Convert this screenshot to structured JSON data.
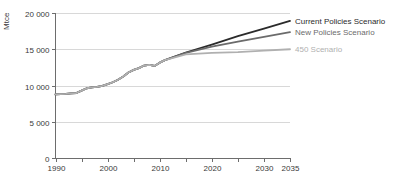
{
  "chart_data": {
    "type": "line",
    "title": "",
    "xlabel": "",
    "ylabel": "Mtce",
    "xlim": [
      1990,
      2035
    ],
    "ylim": [
      0,
      20000
    ],
    "grid": true,
    "legend_position": "right-inline",
    "x_ticks_major": [
      "1990",
      "2000",
      "2010",
      "2020",
      "2030",
      "2035"
    ],
    "x_ticks_major_values": [
      1990,
      2000,
      2010,
      2020,
      2030,
      2035
    ],
    "x_ticks_minor_values": [
      1995,
      2005,
      2015,
      2025
    ],
    "y_ticks": [
      "0",
      "5 000",
      "10 000",
      "15 000",
      "20 000"
    ],
    "y_tick_values": [
      0,
      5000,
      10000,
      15000,
      20000
    ],
    "history_end": 2011,
    "series": [
      {
        "name": "Current Policies Scenario",
        "color": "#2b2b2b",
        "stroke_width": 1.8,
        "x": [
          1990,
          1991,
          1992,
          1993,
          1994,
          1995,
          1996,
          1997,
          1998,
          1999,
          2000,
          2001,
          2002,
          2003,
          2004,
          2005,
          2006,
          2007,
          2008,
          2009,
          2010,
          2011,
          2015,
          2020,
          2025,
          2030,
          2035
        ],
        "values": [
          8780,
          8820,
          8850,
          8900,
          8960,
          9300,
          9620,
          9750,
          9800,
          9950,
          10200,
          10450,
          10800,
          11250,
          11800,
          12150,
          12400,
          12750,
          12850,
          12700,
          13150,
          13500,
          14550,
          15650,
          16800,
          17850,
          18900
        ]
      },
      {
        "name": "New Policies Scenario",
        "color": "#6b6b6b",
        "stroke_width": 1.8,
        "x": [
          1990,
          1991,
          1992,
          1993,
          1994,
          1995,
          1996,
          1997,
          1998,
          1999,
          2000,
          2001,
          2002,
          2003,
          2004,
          2005,
          2006,
          2007,
          2008,
          2009,
          2010,
          2011,
          2015,
          2020,
          2025,
          2030,
          2035
        ],
        "values": [
          8780,
          8820,
          8850,
          8900,
          8960,
          9300,
          9620,
          9750,
          9800,
          9950,
          10200,
          10450,
          10800,
          11250,
          11800,
          12150,
          12400,
          12750,
          12850,
          12700,
          13150,
          13500,
          14500,
          15350,
          16050,
          16700,
          17350
        ]
      },
      {
        "name": "450 Scenario",
        "color": "#b0b0b0",
        "stroke_width": 1.8,
        "x": [
          1990,
          1991,
          1992,
          1993,
          1994,
          1995,
          1996,
          1997,
          1998,
          1999,
          2000,
          2001,
          2002,
          2003,
          2004,
          2005,
          2006,
          2007,
          2008,
          2009,
          2010,
          2011,
          2015,
          2020,
          2025,
          2030,
          2035
        ],
        "values": [
          8780,
          8820,
          8850,
          8900,
          8960,
          9300,
          9620,
          9750,
          9800,
          9950,
          10200,
          10450,
          10800,
          11250,
          11800,
          12150,
          12400,
          12750,
          12850,
          12700,
          13150,
          13500,
          14300,
          14500,
          14600,
          14800,
          15000
        ]
      }
    ],
    "legend": [
      {
        "label": "Current Policies Scenario",
        "color": "#2b2b2b",
        "value_at_end": 18900
      },
      {
        "label": "New Policies Scenario",
        "color": "#6b6b6b",
        "value_at_end": 17350
      },
      {
        "label": "450 Scenario",
        "color": "#b0b0b0",
        "value_at_end": 15000
      }
    ]
  },
  "colors": {
    "background": "#ffffff",
    "axis": "#6d6d6d",
    "grid": "#d8d8d8",
    "text": "#3a3a3a"
  }
}
